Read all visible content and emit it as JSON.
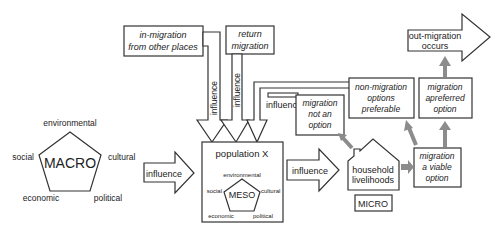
{
  "macro": {
    "label": "MACRO",
    "factors": {
      "top": "environmental",
      "left": "social",
      "right": "cultural",
      "bottom_left": "economic",
      "bottom_right": "political"
    }
  },
  "meso": {
    "label": "MESO",
    "container_label": "population X",
    "factors": {
      "top": "environmental",
      "left": "social",
      "right": "cultural",
      "bottom_left": "economic",
      "bottom_right": "political"
    }
  },
  "micro": {
    "label": "MICRO",
    "house_line1": "household",
    "house_line2": "livelihoods"
  },
  "arrows": {
    "macro_to_meso": "influence",
    "meso_to_micro": "influence",
    "in_migration_influence": "influence",
    "return_migration_influence": "influence",
    "feedback_influence": "influence"
  },
  "boxes": {
    "in_migration": {
      "line1": "in-migration",
      "line2": "from other places"
    },
    "return_migration": {
      "line1": "return",
      "line2": "migration"
    },
    "migration_not_option": {
      "line1": "migration",
      "line2": "not an",
      "line3": "option"
    },
    "non_migration_preferable": {
      "line1": "non-migration",
      "line2": "options",
      "line3": "preferable"
    },
    "migration_viable": {
      "line1": "migration",
      "line2": "a viable",
      "line3": "option"
    },
    "migration_preferred": {
      "line1": "migration",
      "line2": "apreferred",
      "line3": "option"
    },
    "out_migration": {
      "line1": "out-migration",
      "line2": "occurs"
    }
  },
  "colors": {
    "stroke": "#333333",
    "feedback_arrow": "#8c8c8c",
    "background": "#ffffff"
  }
}
